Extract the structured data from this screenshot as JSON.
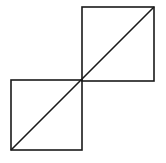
{
  "canvas": {
    "width": 166,
    "height": 163,
    "background": "#ffffff"
  },
  "stroke": {
    "color": "#1a1a1a",
    "width": 1.6
  },
  "shapes": {
    "square_top_right": {
      "x": 82,
      "y": 7,
      "w": 72,
      "h": 74
    },
    "square_bottom_left": {
      "x": 11,
      "y": 80,
      "w": 71,
      "h": 70
    },
    "diagonal": {
      "x1": 11,
      "y1": 150,
      "x2": 154,
      "y2": 7
    }
  }
}
